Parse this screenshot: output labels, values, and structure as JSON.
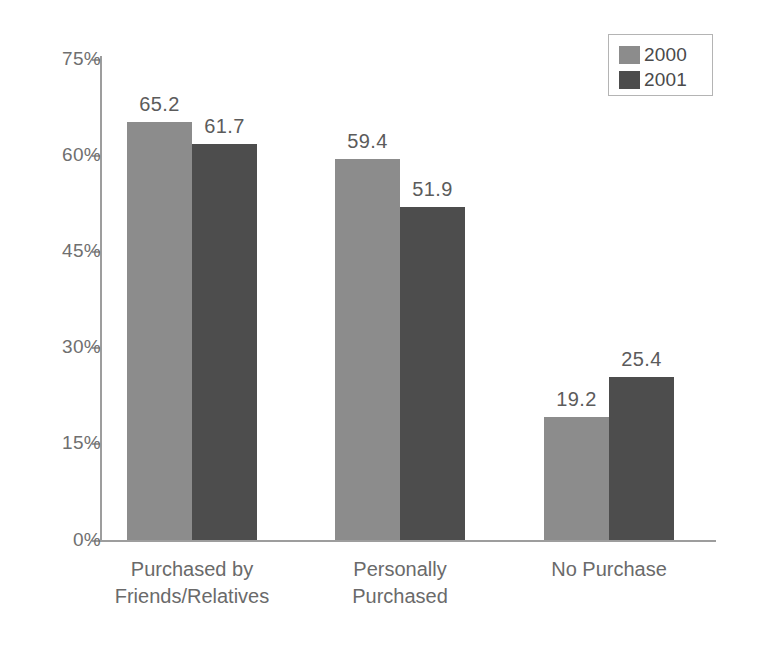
{
  "chart_data": {
    "type": "bar",
    "title": "",
    "subtitle": "",
    "xlabel": "",
    "ylabel": "",
    "ylim": [
      0,
      75
    ],
    "grid": false,
    "legend_position": "top-right",
    "categories": [
      "Purchased by\nFriends/Relatives",
      "Personally\nPurchased",
      "No Purchase"
    ],
    "ticks": [
      "75%",
      "60%",
      "45%",
      "30%",
      "15%",
      "0%"
    ],
    "tick_values": [
      75,
      60,
      45,
      30,
      15,
      0
    ],
    "series": [
      {
        "name": "2000",
        "color": "#8c8c8c",
        "values": [
          65.2,
          59.4,
          19.2
        ],
        "labels": [
          "65.2",
          "59.4",
          "19.2"
        ]
      },
      {
        "name": "2001",
        "color": "#4d4d4d",
        "values": [
          61.7,
          51.9,
          25.4
        ],
        "labels": [
          "61.7",
          "51.9",
          "25.4"
        ]
      }
    ]
  },
  "legend": {
    "items": [
      {
        "label": "2000",
        "color": "#8c8c8c"
      },
      {
        "label": "2001",
        "color": "#4d4d4d"
      }
    ]
  },
  "axis": {
    "line_color": "#9d9d9d",
    "label_color": "#6f6f6f"
  }
}
